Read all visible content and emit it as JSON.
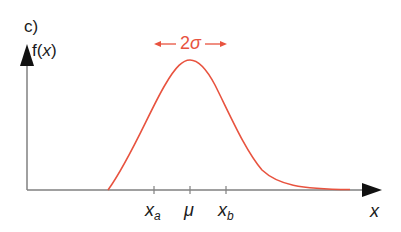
{
  "diagram": {
    "panel_label": "c)",
    "y_axis_label_fn": "f(",
    "y_axis_label_var": "x",
    "y_axis_label_close": ")",
    "x_axis_label": "x",
    "width_annotation": {
      "prefix": "2",
      "symbol": "σ",
      "color": "#e8533f"
    },
    "ticks": [
      {
        "id": "xa",
        "main": "x",
        "sub": "a"
      },
      {
        "id": "mu",
        "main": "μ",
        "sub": ""
      },
      {
        "id": "xb",
        "main": "x",
        "sub": "b"
      }
    ],
    "curve": {
      "type": "skewed bell curve (probability density)",
      "color": "#e8533f",
      "peak_at": "μ"
    },
    "axis_color": "#808080"
  }
}
